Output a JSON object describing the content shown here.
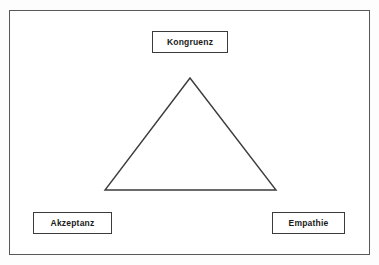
{
  "diagram": {
    "type": "triangle-relationship",
    "frame": {
      "name": "outer-border"
    },
    "shape": {
      "name": "triangle",
      "apex": {
        "x": 190,
        "y": 78
      },
      "bottom_left": {
        "x": 105,
        "y": 190
      },
      "bottom_right": {
        "x": 276,
        "y": 190
      },
      "stroke_color": "#3b3b3d",
      "fill": "none"
    },
    "nodes": [
      {
        "id": "kongruenz",
        "label": "Kongruenz",
        "position": "top"
      },
      {
        "id": "akzeptanz",
        "label": "Akzeptanz",
        "position": "bottom-left"
      },
      {
        "id": "empathie",
        "label": "Empathie",
        "position": "bottom-right"
      }
    ],
    "colors": {
      "background": "#ffffff",
      "line": "#3b3b3d",
      "frame": "#58585a",
      "text": "#1a1a1a"
    }
  }
}
